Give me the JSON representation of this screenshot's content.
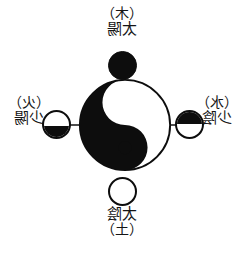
{
  "figure": {
    "type": "diagram",
    "mirrored": true,
    "background_color": "#ffffff",
    "ink_color": "#0d0d0d",
    "axis_color": "#4d4d4d"
  },
  "center": {
    "symbol_name": "taiji-yin-yang",
    "yang_color": "#ffffff",
    "yin_color": "#0d0d0d"
  },
  "axis": {
    "name": "horizontal-axis-line"
  },
  "labels": {
    "top": {
      "paren": "（木）",
      "name": "太陽",
      "marker": "solid-black-circle"
    },
    "bottom": {
      "paren": "（土）",
      "name": "太陰",
      "marker": "hollow-white-circle"
    },
    "left": {
      "paren": "（火）",
      "name": "少陽",
      "marker": "half-circle-bottom-black"
    },
    "right": {
      "paren": "（水）",
      "name": "少陰",
      "marker": "half-circle-top-black"
    }
  }
}
